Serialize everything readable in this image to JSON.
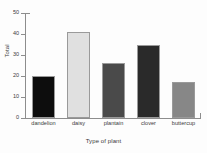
{
  "chart_data": {
    "type": "bar",
    "title": "",
    "xlabel": "Type of plant",
    "ylabel": "Total",
    "categories": [
      "dandelion",
      "daisy",
      "plantain",
      "clover",
      "buttercup"
    ],
    "values": [
      20,
      41,
      26,
      35,
      17
    ],
    "bar_colors": [
      "#0d0d0d",
      "#e0e0e0",
      "#4a4a4a",
      "#2a2a2a",
      "#878787"
    ],
    "ylim": [
      0,
      50
    ],
    "yticks": [
      0,
      10,
      20,
      30,
      40,
      50
    ],
    "ytick_labels": [
      "0",
      "10",
      "20",
      "30",
      "40",
      "50"
    ],
    "grid": false,
    "legend": false,
    "background": "#fdfdfd",
    "axis_color": "#8d8d8d",
    "text_color": "#3a3a3a"
  }
}
